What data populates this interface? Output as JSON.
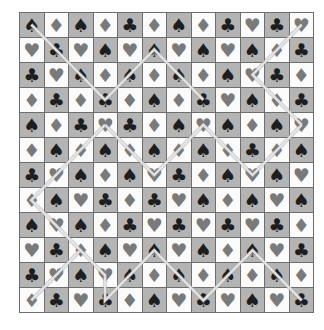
{
  "board": {
    "rows": 12,
    "cols": 12,
    "symbols": {
      "S": "♠",
      "H": "♥",
      "D": "♦",
      "C": "♣"
    },
    "grid": [
      [
        "S",
        "D",
        "S",
        "D",
        "C",
        "D",
        "S",
        "D",
        "C",
        "H",
        "C",
        "H"
      ],
      [
        "H",
        "C",
        "H",
        "S",
        "H",
        "S",
        "H",
        "S",
        "H",
        "S",
        "D",
        "C"
      ],
      [
        "C",
        "H",
        "S",
        "D",
        "S",
        "D",
        "S",
        "D",
        "S",
        "H",
        "C",
        "D"
      ],
      [
        "D",
        "C",
        "D",
        "C",
        "D",
        "S",
        "D",
        "C",
        "H",
        "S",
        "D",
        "C"
      ],
      [
        "S",
        "D",
        "C",
        "H",
        "C",
        "D",
        "S",
        "H",
        "S",
        "D",
        "S",
        "H"
      ],
      [
        "D",
        "S",
        "D",
        "S",
        "D",
        "S",
        "D",
        "S",
        "D",
        "C",
        "D",
        "S"
      ],
      [
        "C",
        "H",
        "S",
        "D",
        "S",
        "H",
        "C",
        "D",
        "S",
        "H",
        "S",
        "H"
      ],
      [
        "D",
        "S",
        "H",
        "C",
        "D",
        "C",
        "H",
        "S",
        "D",
        "S",
        "H",
        "S"
      ],
      [
        "S",
        "H",
        "S",
        "D",
        "C",
        "H",
        "C",
        "H",
        "C",
        "H",
        "C",
        "D"
      ],
      [
        "H",
        "C",
        "D",
        "S",
        "H",
        "S",
        "H",
        "S",
        "D",
        "S",
        "H",
        "C"
      ],
      [
        "C",
        "H",
        "S",
        "H",
        "S",
        "D",
        "S",
        "D",
        "S",
        "D",
        "S",
        "D"
      ],
      [
        "D",
        "C",
        "H",
        "C",
        "D",
        "S",
        "H",
        "C",
        "H",
        "S",
        "H",
        "C"
      ]
    ],
    "colors": {
      "dark_cell": "#b4b4b4",
      "light_cell": "#fbfbfb",
      "black_suit": "#1e1e1e",
      "red_suit": "#7a7a7a",
      "path": "#e6e6e6"
    },
    "paths": [
      [
        [
          0,
          0
        ],
        [
          3,
          3
        ],
        [
          5,
          1
        ],
        [
          7,
          3
        ]
      ],
      [
        [
          11,
          0
        ],
        [
          9,
          2
        ],
        [
          11,
          4
        ]
      ],
      [
        [
          3,
          4
        ],
        [
          5,
          6
        ],
        [
          7,
          4
        ],
        [
          9,
          6
        ],
        [
          11,
          4
        ]
      ],
      [
        [
          3,
          4
        ],
        [
          0,
          7
        ],
        [
          2,
          9
        ],
        [
          0,
          11
        ]
      ],
      [
        [
          2,
          9
        ],
        [
          3,
          10
        ],
        [
          3,
          11
        ],
        [
          5,
          9
        ],
        [
          7,
          11
        ],
        [
          9,
          9
        ],
        [
          11,
          11
        ]
      ]
    ]
  }
}
